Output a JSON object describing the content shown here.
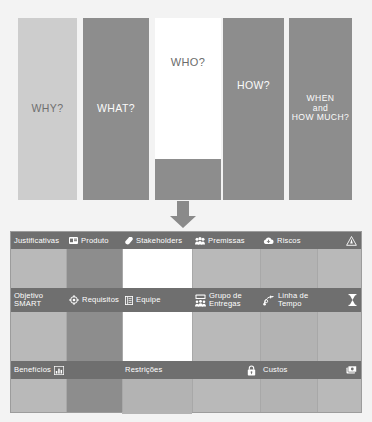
{
  "diagram": {
    "top_panel": {
      "bars": [
        {
          "id": "why",
          "label": "WHY?",
          "color": "#cdcdcd",
          "text_color": "#6f6f6f"
        },
        {
          "id": "what",
          "label": "WHAT?",
          "color": "#8d8d8d",
          "text_color": "#fbfbfb"
        },
        {
          "id": "who",
          "label": "WHO?",
          "color": "#ffffff",
          "text_color": "#6b6b6b"
        },
        {
          "id": "how",
          "label": "HOW?",
          "color": "#8d8d8d",
          "text_color": "#fbfbfb"
        },
        {
          "id": "when",
          "label": "WHEN\nand\nHOW MUCH?",
          "color": "#8d8d8d",
          "text_color": "#fbfbfb"
        }
      ]
    },
    "arrow": {
      "icon": "arrow-down-icon",
      "color": "#8a8a8a"
    },
    "canvas": {
      "rows": [
        {
          "id": "row-1",
          "cells": [
            {
              "id": "justificativas",
              "label": "Justificativas",
              "icon": "none",
              "icon_right": "none"
            },
            {
              "id": "produto",
              "label": "Produto",
              "icon": "card-icon",
              "icon_right": "none"
            },
            {
              "id": "stakeholders",
              "label": "Stakeholders",
              "icon": "tag-icon",
              "icon_right": "none"
            },
            {
              "id": "premissas",
              "label": "Premissas",
              "icon": "people-icon",
              "icon_right": "none"
            },
            {
              "id": "riscos",
              "label": "Riscos",
              "icon": "cloud-down-icon",
              "icon_right": "warning-triangle-icon"
            }
          ]
        },
        {
          "id": "row-2",
          "cells": [
            {
              "id": "objetivo-smart",
              "label": "Objetivo\nSMART",
              "icon": "none",
              "icon_right": "none"
            },
            {
              "id": "requisitos",
              "label": "Requisitos",
              "icon": "target-icon",
              "icon_right": "none"
            },
            {
              "id": "equipe",
              "label": "Equipe",
              "icon": "list-icon",
              "icon_right": "none"
            },
            {
              "id": "grupo-entregas",
              "label": "Grupo de\nEntregas",
              "icon": "group-icon",
              "icon_right": "none"
            },
            {
              "id": "linha-tempo",
              "label": "Linha de\nTempo",
              "icon": "timeline-icon",
              "icon_right": "hourglass-icon"
            }
          ]
        },
        {
          "id": "row-3",
          "cells": [
            {
              "id": "beneficios",
              "label": "Benefícios",
              "icon": "none",
              "icon_right": "bar-chart-icon"
            },
            {
              "id": "restricoes",
              "label": "Restrições",
              "icon": "none",
              "icon_right": "lock-icon"
            },
            {
              "id": "custos",
              "label": "Custos",
              "icon": "none",
              "icon_right": "money-icon"
            }
          ]
        }
      ]
    },
    "colors": {
      "background": "#f3f3f3",
      "light_gray": "#cdcdcd",
      "mid_gray": "#b3b3b3",
      "dark_gray": "#8d8d8d",
      "label_bar": "#6f6f6f",
      "white": "#ffffff"
    }
  }
}
